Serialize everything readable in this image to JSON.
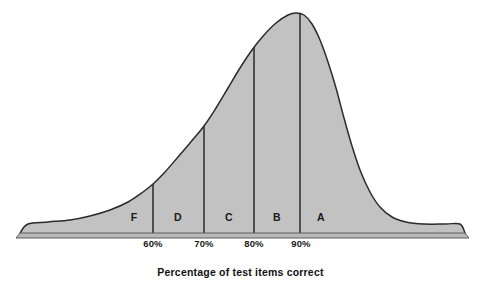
{
  "chart_data": {
    "type": "area",
    "title": "",
    "subtitle": "",
    "xlabel": "Percentage of test items correct",
    "ylabel": "",
    "grid": false,
    "legend": "none",
    "xlim": [
      40,
      100
    ],
    "ylim": [
      0,
      1
    ],
    "axis": {
      "baseline_visible": true,
      "y_axis_visible": false,
      "tick_marks_visible": false
    },
    "tick_labels": [
      "60%",
      "70%",
      "80%",
      "90%"
    ],
    "tick_positions_px": [
      153,
      204,
      254,
      301
    ],
    "cut_lines_px": [
      153,
      204,
      254,
      300
    ],
    "bands": [
      {
        "label": "F",
        "center_px": 134,
        "range": "below 60%"
      },
      {
        "label": "D",
        "center_px": 178,
        "range": "60%-69%"
      },
      {
        "label": "C",
        "center_px": 229,
        "range": "70%-79%"
      },
      {
        "label": "B",
        "center_px": 277,
        "range": "80%-89%"
      },
      {
        "label": "A",
        "center_px": 321,
        "range": "90% and above"
      }
    ],
    "curve_points_px": [
      [
        20,
        233
      ],
      [
        28,
        224
      ],
      [
        48,
        222
      ],
      [
        70,
        220
      ],
      [
        90,
        216
      ],
      [
        110,
        210
      ],
      [
        128,
        202
      ],
      [
        143,
        192
      ],
      [
        153,
        184
      ],
      [
        165,
        172
      ],
      [
        178,
        157
      ],
      [
        190,
        143
      ],
      [
        204,
        126
      ],
      [
        216,
        108
      ],
      [
        228,
        88
      ],
      [
        240,
        68
      ],
      [
        252,
        50
      ],
      [
        264,
        35
      ],
      [
        276,
        23
      ],
      [
        288,
        15
      ],
      [
        296,
        13
      ],
      [
        304,
        15
      ],
      [
        312,
        24
      ],
      [
        320,
        40
      ],
      [
        328,
        62
      ],
      [
        336,
        88
      ],
      [
        344,
        118
      ],
      [
        352,
        146
      ],
      [
        360,
        170
      ],
      [
        370,
        192
      ],
      [
        380,
        207
      ],
      [
        392,
        217
      ],
      [
        406,
        222
      ],
      [
        424,
        224
      ],
      [
        446,
        224
      ],
      [
        460,
        224
      ],
      [
        465,
        233
      ]
    ],
    "colors": {
      "fill": "#c2c2c2",
      "outline": "#2b2b2b",
      "cut_line": "#1e1e1e",
      "baseline": "#555555",
      "text": "#1a1a1a",
      "background": "#ffffff"
    }
  },
  "caption": {
    "text": "Percentage of test items correct"
  }
}
